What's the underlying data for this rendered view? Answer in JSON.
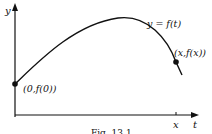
{
  "figure": {
    "axes": {
      "y_label": "y",
      "x_label": "t",
      "x_tick_label": "x"
    },
    "curve": {
      "label": "y = f(t)"
    },
    "points": [
      {
        "label": "(0,f(0))"
      },
      {
        "label": "(x,f(x))"
      }
    ],
    "caption": "Fig. 13.1",
    "colors": {
      "ink": "#111111",
      "background": "#ffffff"
    }
  }
}
